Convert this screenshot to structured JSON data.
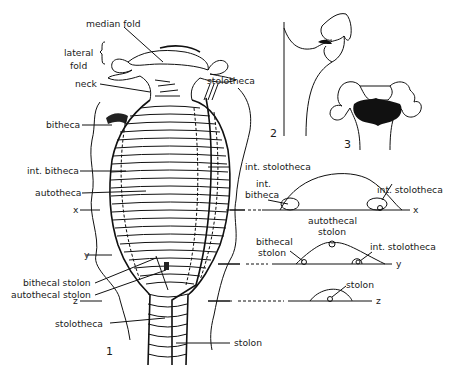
{
  "figure": {
    "panels": [
      {
        "id": "1",
        "label": "1"
      },
      {
        "id": "2",
        "label": "2"
      },
      {
        "id": "3",
        "label": "3"
      }
    ],
    "labels": {
      "median_fold": "median fold",
      "lateral_fold_1": "lateral",
      "lateral_fold_2": "fold",
      "neck": "neck",
      "stolotheca_top": "stolotheca",
      "bitheca": "bitheca",
      "int_bitheca": "int. bitheca",
      "int_stolotheca": "int. stolotheca",
      "autotheca": "autotheca",
      "bithecal_stolon": "bithecal stolon",
      "autothecal_stolon": "autothecal stolon",
      "stolotheca_bottom": "stolotheca",
      "stolon_bottom": "stolon"
    },
    "sections": {
      "x": {
        "axis": "x",
        "int_bitheca_1": "int.",
        "int_bitheca_2": "bitheca",
        "int_stolotheca": "int. stolotheca"
      },
      "y": {
        "axis": "y",
        "autothecal_stolon_1": "autothecal",
        "autothecal_stolon_2": "stolon",
        "bithecal_stolon_1": "bithecal",
        "bithecal_stolon_2": "stolon",
        "int_stolotheca": "int. stolotheca"
      },
      "z": {
        "axis": "z",
        "stolon": "stolon"
      }
    },
    "left_axes": {
      "x": "x",
      "y": "y",
      "z": "z"
    }
  }
}
